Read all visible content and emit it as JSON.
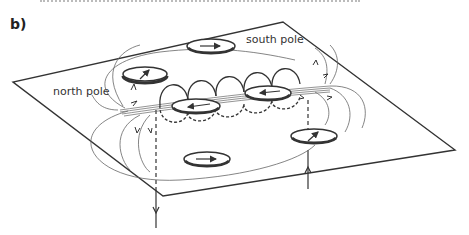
{
  "figure": {
    "panel_label": "b)",
    "labels": {
      "south_pole": "south pole",
      "north_pole": "north pole"
    },
    "compasses": [
      {
        "id": "top-center",
        "needle": "right"
      },
      {
        "id": "top-left",
        "needle": "up-right"
      },
      {
        "id": "coil-left",
        "needle": "left"
      },
      {
        "id": "coil-right",
        "needle": "left"
      },
      {
        "id": "right",
        "needle": "up-right"
      },
      {
        "id": "bottom",
        "needle": "right"
      }
    ],
    "current": {
      "left_wire_direction": "down",
      "right_wire_direction": "up"
    },
    "colors": {
      "line": "#333333",
      "field_line": "#555555",
      "background": "#ffffff"
    }
  }
}
